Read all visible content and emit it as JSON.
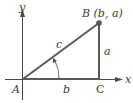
{
  "diagram": {
    "type": "right-triangle-on-axes",
    "axes": {
      "x_label": "x",
      "y_label": "y"
    },
    "vertices": {
      "A": {
        "label": "A"
      },
      "B": {
        "label": "B (b, a)"
      },
      "C": {
        "label": "C"
      }
    },
    "sides": {
      "hypotenuse": {
        "label": "c"
      },
      "vertical": {
        "label": "a"
      },
      "horizontal": {
        "label": "b"
      }
    },
    "colors": {
      "triangle": "#5a5a5a",
      "axes": "#4a4a4a",
      "point": "#555555",
      "text": "#3a3a3a"
    }
  }
}
